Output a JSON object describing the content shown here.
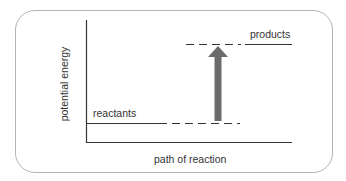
{
  "diagram": {
    "type": "energy-level-diagram",
    "y_axis_label": "potential energy",
    "x_axis_label": "path of reaction",
    "levels": [
      {
        "name": "reactants",
        "label": "reactants",
        "relative_energy": "low"
      },
      {
        "name": "products",
        "label": "products",
        "relative_energy": "high"
      }
    ],
    "arrow": {
      "direction": "up",
      "from": "reactants",
      "to": "products",
      "color": "#6b6b6b"
    },
    "colors": {
      "frame": "#b4b4b4",
      "lines": "#333333",
      "arrow": "#6b6b6b"
    }
  }
}
